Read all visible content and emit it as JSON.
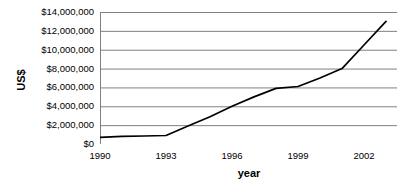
{
  "chart_data": {
    "type": "line",
    "title": "",
    "xlabel": "year",
    "ylabel": "US$",
    "x": [
      1990,
      1991,
      1992,
      1993,
      1994,
      1995,
      1996,
      1997,
      1998,
      1999,
      2000,
      2001,
      2002,
      2003
    ],
    "values": [
      700000,
      800000,
      850000,
      900000,
      1900000,
      2900000,
      4000000,
      5000000,
      5900000,
      6100000,
      7000000,
      8000000,
      10500000,
      13000000
    ],
    "series": [
      {
        "name": "US$",
        "values": [
          700000,
          800000,
          850000,
          900000,
          1900000,
          2900000,
          4000000,
          5000000,
          5900000,
          6100000,
          7000000,
          8000000,
          10500000,
          13000000
        ]
      }
    ],
    "xlim": [
      1990,
      2003.5
    ],
    "ylim": [
      0,
      14000000
    ],
    "y_ticks": [
      0,
      2000000,
      4000000,
      6000000,
      8000000,
      10000000,
      12000000,
      14000000
    ],
    "y_tick_labels": [
      "$0",
      "$2,000,000",
      "$4,000,000",
      "$6,000,000",
      "$8,000,000",
      "$10,000,000",
      "$12,000,000",
      "$14,000,000"
    ],
    "x_ticks": [
      1990,
      1993,
      1996,
      1999,
      2002
    ],
    "x_tick_labels": [
      "1990",
      "1993",
      "1996",
      "1999",
      "2002"
    ],
    "x_minor_ticks": [
      1991,
      1992,
      1994,
      1995,
      1997,
      1998,
      2000,
      2001,
      2003
    ],
    "grid": "horizontal",
    "legend": "none",
    "line_color": "#000000",
    "grid_color": "#808080",
    "axis_color": "#808080",
    "background_color": "#ffffff"
  },
  "axes": {
    "y_title": "US$",
    "x_title": "year"
  }
}
